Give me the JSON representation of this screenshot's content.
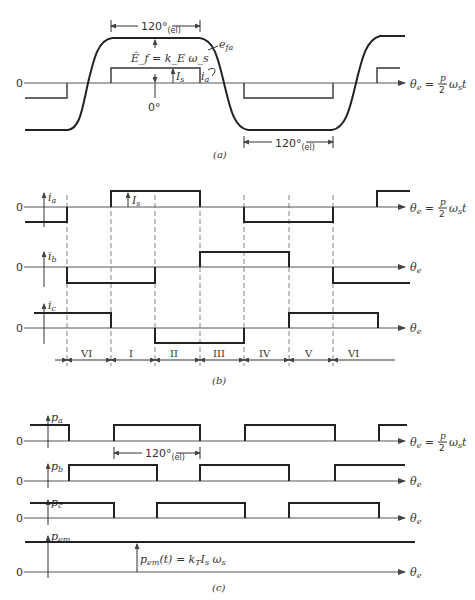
{
  "panel_a": {
    "caption": "(a)",
    "zero_label": "0",
    "angle_label": "120°",
    "angle_sub": "(el)",
    "angle_label_bottom": "120°",
    "angle_sub_bottom": "(el)",
    "emf_eq": "Ê_f = k_E ω_s",
    "emf_label": "e_fa",
    "current_label": "i_a",
    "amplitude_label": "I_s",
    "origin_label": "0°",
    "axis_label": "θ_e = p/2 ω_s t",
    "axis_label_lhs": "θ",
    "axis_label_sub": "e",
    "axis_label_eq": "=",
    "axis_label_num": "p",
    "axis_label_den": "2",
    "axis_label_rhs": "ω",
    "axis_label_rhs_sub": "s",
    "axis_label_t": "t"
  },
  "panel_b": {
    "caption": "(b)",
    "traces": [
      {
        "name": "i_a",
        "sym": "i",
        "sub": "a",
        "zero": "0",
        "axis_label": "θ_e = p/2 ω_s t"
      },
      {
        "name": "i_b",
        "sym": "i",
        "sub": "b",
        "zero": "0",
        "axis_label": "θ_e"
      },
      {
        "name": "i_c",
        "sym": "i",
        "sub": "c",
        "zero": "0",
        "axis_label": "θ_e"
      }
    ],
    "amplitude_label": "I_s",
    "sectors": [
      "VI",
      "I",
      "II",
      "III",
      "IV",
      "V",
      "VI"
    ]
  },
  "panel_c": {
    "caption": "(c)",
    "traces": [
      {
        "name": "p_a",
        "sym": "p",
        "sub": "a",
        "zero": "0",
        "axis_label": "θ_e = p/2 ω_s t"
      },
      {
        "name": "p_b",
        "sym": "p",
        "sub": "b",
        "zero": "0",
        "axis_label": "θ_e"
      },
      {
        "name": "p_c",
        "sym": "p",
        "sub": "c",
        "zero": "0",
        "axis_label": "θ_e"
      },
      {
        "name": "p_em",
        "sym": "p",
        "sub": "em",
        "zero": "0",
        "axis_label": "θ_e"
      }
    ],
    "angle_label": "120°",
    "angle_sub": "(el)",
    "pem_eq": "p_em(t) = k_T I_s ω_s"
  },
  "colors": {
    "line": "#222222",
    "axis": "#555555",
    "background": "#ffffff"
  }
}
